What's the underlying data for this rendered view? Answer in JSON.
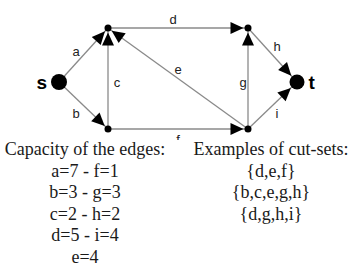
{
  "graph": {
    "nodes": [
      {
        "id": "s",
        "label": "s",
        "x": 59,
        "y": 82,
        "r": 8
      },
      {
        "id": "u",
        "label": "",
        "x": 108,
        "y": 28,
        "r": 3.5
      },
      {
        "id": "v",
        "label": "",
        "x": 108,
        "y": 129,
        "r": 3.5
      },
      {
        "id": "w",
        "label": "",
        "x": 248,
        "y": 28,
        "r": 3.5
      },
      {
        "id": "x",
        "label": "",
        "x": 248,
        "y": 129,
        "r": 3.5
      },
      {
        "id": "t",
        "label": "t",
        "x": 297,
        "y": 82,
        "r": 7.5
      }
    ],
    "edges": [
      {
        "id": "a",
        "label": "a",
        "from": "s",
        "to": "u",
        "label_x": 76,
        "label_y": 51
      },
      {
        "id": "b",
        "label": "b",
        "from": "s",
        "to": "v",
        "label_x": 76,
        "label_y": 113
      },
      {
        "id": "c",
        "label": "c",
        "from": "v",
        "to": "u",
        "label_x": 117,
        "label_y": 82
      },
      {
        "id": "d",
        "label": "d",
        "from": "u",
        "to": "w",
        "label_x": 173,
        "label_y": 19
      },
      {
        "id": "e",
        "label": "e",
        "from": "x",
        "to": "u",
        "label_x": 178,
        "label_y": 69
      },
      {
        "id": "f",
        "label": "f",
        "from": "v",
        "to": "x",
        "label_x": 178,
        "label_y": 139
      },
      {
        "id": "g",
        "label": "g",
        "from": "x",
        "to": "w",
        "label_x": 243,
        "label_y": 82
      },
      {
        "id": "h",
        "label": "h",
        "from": "w",
        "to": "t",
        "label_x": 277,
        "label_y": 46
      },
      {
        "id": "i",
        "label": "i",
        "from": "x",
        "to": "t",
        "label_x": 277,
        "label_y": 113
      }
    ],
    "edge_color": "#8a8a8a",
    "node_color": "#000000"
  },
  "capacity": {
    "heading": "Capacity of the edges:",
    "lines": [
      "a=7 - f=1",
      "b=3 - g=3",
      "c=2 - h=2",
      "d=5 - i=4",
      "e=4"
    ]
  },
  "cutsets": {
    "heading": "Examples of cut-sets:",
    "lines": [
      "{d,e,f}",
      "{b,c,e,g,h}",
      "{d,g,h,i}"
    ]
  }
}
